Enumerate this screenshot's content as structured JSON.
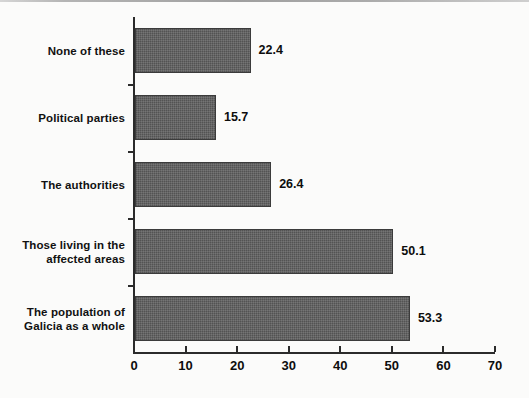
{
  "chart_data": {
    "type": "bar",
    "orientation": "horizontal",
    "title": "",
    "subtitle": "",
    "xlabel": "",
    "ylabel": "",
    "categories": [
      "None of these",
      "Political parties",
      "The authorities",
      "Those living in the\naffected areas",
      "The population of\nGalicia as a whole"
    ],
    "category_lines": [
      [
        "None of these"
      ],
      [
        "Political parties"
      ],
      [
        "The authorities"
      ],
      [
        "Those living in the",
        "affected areas"
      ],
      [
        "The population of",
        "Galicia as a whole"
      ]
    ],
    "values": [
      22.4,
      15.7,
      26.4,
      50.1,
      53.3
    ],
    "value_labels": [
      "22.4",
      "15.7",
      "26.4",
      "50.1",
      "53.3"
    ],
    "xlim": [
      0,
      70
    ],
    "xticks": [
      0,
      10,
      20,
      30,
      40,
      50,
      60,
      70
    ],
    "xtick_labels": [
      "0",
      "10",
      "20",
      "30",
      "40",
      "50",
      "60",
      "70"
    ],
    "grid": false,
    "legend": null,
    "bar_color": "#535353",
    "axis_color": "#2b2b2b",
    "text_color": "#0d0d0d",
    "background_color": "#fbfbfa"
  }
}
